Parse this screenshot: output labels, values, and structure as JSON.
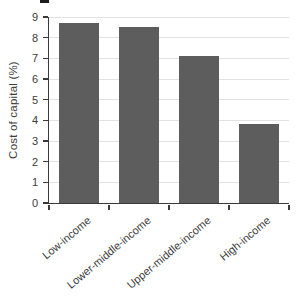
{
  "chart_data": {
    "type": "bar",
    "categories": [
      "Low-income",
      "Lower-middle-income",
      "Upper-middle-income",
      "High-income"
    ],
    "values": [
      8.7,
      8.5,
      7.1,
      3.8
    ],
    "title": "",
    "xlabel": "",
    "ylabel": "Cost of capital (%)",
    "ylim": [
      0,
      9
    ],
    "yticks": [
      0,
      1,
      2,
      3,
      4,
      5,
      6,
      7,
      8,
      9
    ],
    "grid": true,
    "legend": false,
    "bar_color": "#5d5d5d",
    "gridline_color": "#e3e3e3",
    "axis_color": "#3a3a3a",
    "text_color": "#3b3b3b",
    "background": "#ffffff",
    "x_tick_label_rotation_deg": -40
  }
}
